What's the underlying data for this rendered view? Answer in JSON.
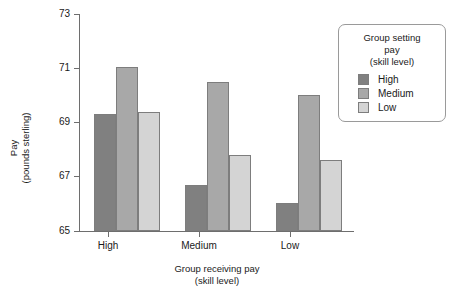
{
  "chart_data": {
    "type": "bar",
    "title": "",
    "xlabel": "Group receiving pay (skill level)",
    "ylabel": "Pay (pounds sterling)",
    "categories": [
      "High",
      "Medium",
      "Low"
    ],
    "series": [
      {
        "name": "High",
        "values": [
          69.3,
          66.7,
          66.05
        ],
        "color": "#808080"
      },
      {
        "name": "Medium",
        "values": [
          71.05,
          70.5,
          70.0
        ],
        "color": "#a8a8a8"
      },
      {
        "name": "Low",
        "values": [
          69.4,
          67.8,
          67.6
        ],
        "color": "#d4d4d4"
      }
    ],
    "ylim": [
      65,
      73
    ],
    "yticks": [
      65,
      67,
      69,
      71,
      73
    ],
    "grid": false,
    "legend_position": "right"
  },
  "axes": {
    "y_label_line1": "Pay",
    "y_label_line2": "(pounds sterling)",
    "x_label_line1": "Group receiving pay",
    "x_label_line2": "(skill level)",
    "y_tick_labels": [
      "73",
      "71",
      "69",
      "67",
      "65"
    ],
    "x_tick_labels": [
      "High",
      "Medium",
      "Low"
    ]
  },
  "legend": {
    "title_line1": "Group setting",
    "title_line2": "pay",
    "title_line3": "(skill level)",
    "items": [
      {
        "label": "High",
        "color": "#808080"
      },
      {
        "label": "Medium",
        "color": "#a8a8a8"
      },
      {
        "label": "Low",
        "color": "#d4d4d4"
      }
    ]
  }
}
